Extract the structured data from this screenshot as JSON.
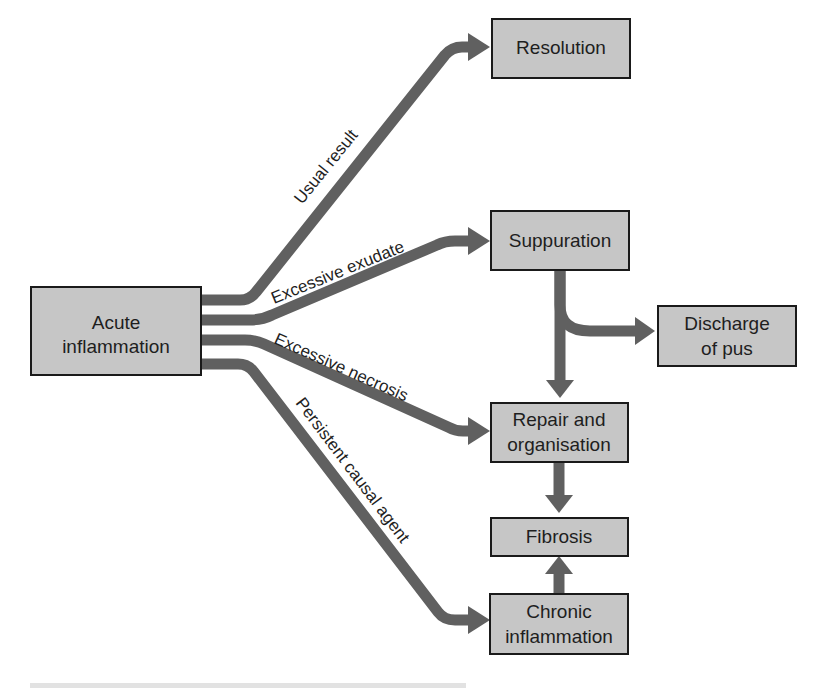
{
  "diagram": {
    "colors": {
      "box_fill": "#c6c6c6",
      "box_border": "#1a1a1a",
      "arrow": "#606060",
      "text": "#1e1e1e"
    },
    "nodes": [
      {
        "id": "acute",
        "lines": [
          "Acute",
          "inflammation"
        ]
      },
      {
        "id": "resolution",
        "lines": [
          "Resolution"
        ]
      },
      {
        "id": "suppuration",
        "lines": [
          "Suppuration"
        ]
      },
      {
        "id": "discharge",
        "lines": [
          "Discharge",
          "of pus"
        ]
      },
      {
        "id": "repair",
        "lines": [
          "Repair and",
          "organisation"
        ]
      },
      {
        "id": "fibrosis",
        "lines": [
          "Fibrosis"
        ]
      },
      {
        "id": "chronic",
        "lines": [
          "Chronic",
          "inflammation"
        ]
      }
    ],
    "edges": [
      {
        "id": "usual-result",
        "from": "acute",
        "to": "resolution",
        "label": "Usual result"
      },
      {
        "id": "excessive-exudate",
        "from": "acute",
        "to": "suppuration",
        "label": "Excessive exudate"
      },
      {
        "id": "excessive-necrosis",
        "from": "acute",
        "to": "repair",
        "label": "Excessive necrosis"
      },
      {
        "id": "persistent-causal-agent",
        "from": "acute",
        "to": "chronic",
        "label": "Persistent causal agent"
      },
      {
        "id": "suppuration-to-discharge",
        "from": "suppuration",
        "to": "discharge",
        "label": ""
      },
      {
        "id": "suppuration-to-repair",
        "from": "suppuration",
        "to": "repair",
        "label": ""
      },
      {
        "id": "repair-to-fibrosis",
        "from": "repair",
        "to": "fibrosis",
        "label": ""
      },
      {
        "id": "chronic-to-fibrosis",
        "from": "chronic",
        "to": "fibrosis",
        "label": ""
      }
    ]
  }
}
